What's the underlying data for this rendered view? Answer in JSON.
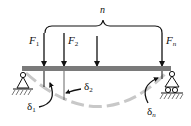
{
  "diagram": {
    "colors": {
      "beam": "#7a7a7a",
      "lines": "#111111",
      "deflection_curve": "#c8c8c8",
      "background": "#ffffff"
    },
    "brace_label": "n",
    "forces": [
      {
        "symbol": "F",
        "subscript": "1",
        "x": 44
      },
      {
        "symbol": "F",
        "subscript": "2",
        "x": 64
      },
      {
        "symbol": "",
        "subscript": "",
        "x": 97
      },
      {
        "symbol": "F",
        "subscript": "n",
        "x": 162
      }
    ],
    "deflections": [
      {
        "symbol": "δ",
        "subscript": "1"
      },
      {
        "symbol": "δ",
        "subscript": "2"
      },
      {
        "symbol": "δ",
        "subscript": "n"
      }
    ],
    "supports": {
      "left": "pin-support",
      "right": "roller-support"
    }
  }
}
